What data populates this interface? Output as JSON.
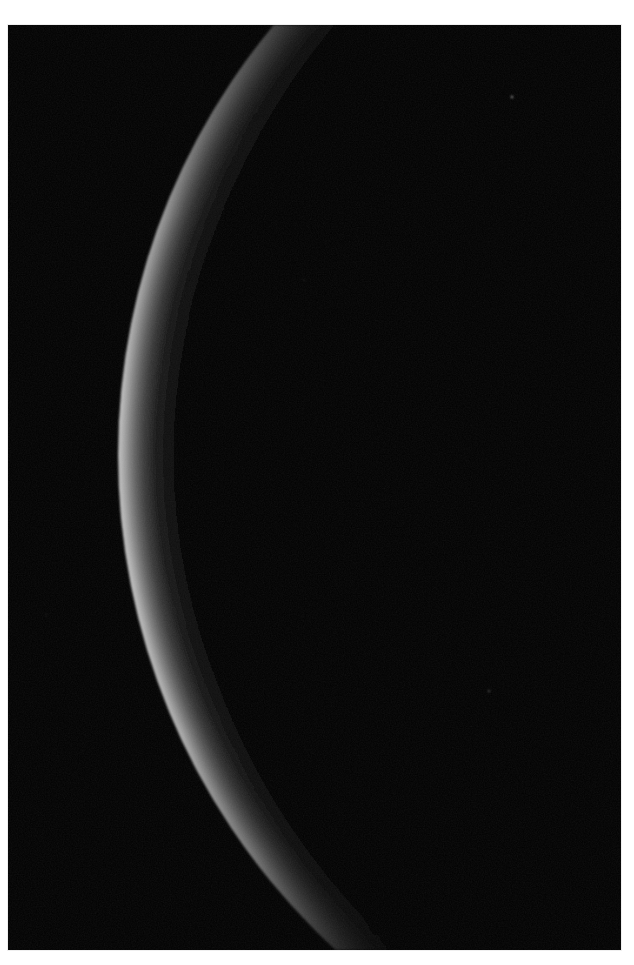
{
  "page": {
    "background_color": "#ffffff",
    "width": 634,
    "height": 965
  },
  "photo": {
    "title": "Crescent limb of a planetary body",
    "frame": {
      "x": 8,
      "y": 25,
      "width": 613,
      "height": 925,
      "background_color": "#010101",
      "border_color": "#efefef"
    },
    "sky": {
      "name": "night-sky-background",
      "color": "#000000",
      "noise_opacity": 0.06
    },
    "crescent": {
      "name": "illuminated-limb",
      "shape": "crescent",
      "description": "Thin sunlit crescent arcing from top-centre down the left side and tapering off to the lower right",
      "outer_circle": {
        "center_x": 782,
        "center_y": 430,
        "radius": 672
      },
      "inner_circle": {
        "center_x": 838,
        "center_y": 430,
        "radius": 672
      },
      "top_entry_point": {
        "x": 284,
        "y": 0
      },
      "leftmost_point": {
        "x": 110,
        "y": 420
      },
      "tip_point": {
        "x": 552,
        "y": 832
      },
      "max_band_width_px": 52,
      "highlight_color": "#b8b8b8",
      "midtone_color": "#6e6e6e",
      "shadow_color": "#141414",
      "limb_color": "#ffffff"
    },
    "stars": [
      {
        "name": "star-upper-right",
        "x": 504,
        "y": 72,
        "size": 2.4,
        "brightness": 0.55
      },
      {
        "name": "star-lower-right",
        "x": 481,
        "y": 666,
        "size": 2.0,
        "brightness": 0.38
      },
      {
        "name": "star-faint-left",
        "x": 38,
        "y": 590,
        "size": 1.4,
        "brightness": 0.18
      },
      {
        "name": "star-faint-mid",
        "x": 296,
        "y": 255,
        "size": 1.3,
        "brightness": 0.16
      }
    ]
  }
}
